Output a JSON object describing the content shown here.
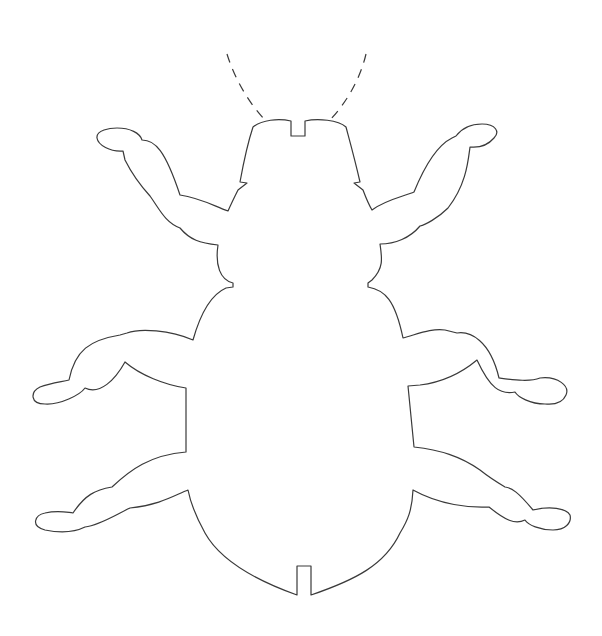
{
  "figure": {
    "background": "#ffffff",
    "stroke_color": "#3a3a3a",
    "parts": {
      "antennae": {
        "count": 2,
        "style": "dashed"
      },
      "head": {
        "notch": "top-center slot"
      },
      "legs": {
        "count": 6,
        "pairs": [
          "front",
          "middle",
          "rear"
        ]
      },
      "abdomen": {
        "notch": "bottom-center slot"
      }
    }
  }
}
